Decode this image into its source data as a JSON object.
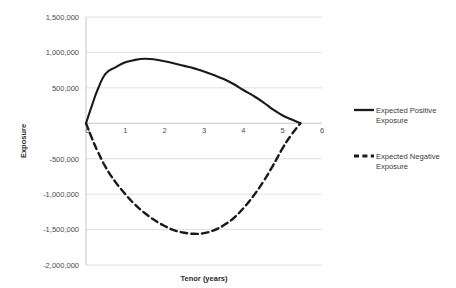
{
  "chart_data": {
    "type": "line",
    "title": "",
    "xlabel": "Tenor (years)",
    "ylabel": "Exposure",
    "xlim": [
      0,
      6
    ],
    "ylim": [
      -2000000,
      1500000
    ],
    "grid": true,
    "legend_position": "right",
    "y_ticks": [
      1500000,
      1000000,
      500000,
      0,
      -500000,
      -1000000,
      -1500000,
      -2000000
    ],
    "y_tick_labels": [
      "1,500,000",
      "1,000,000",
      "500,000",
      "",
      "-500,000",
      "-1,000,000",
      "-1,500,000",
      "-2,000,000"
    ],
    "x_ticks": [
      0,
      1,
      2,
      3,
      4,
      5,
      6
    ],
    "x_tick_labels": [
      "0",
      "1",
      "2",
      "3",
      "4",
      "5",
      "6"
    ],
    "series": [
      {
        "name": "Expected Positive Exposure",
        "style": "solid",
        "color": "#1a1a1a",
        "x": [
          0,
          0.15,
          0.3,
          0.5,
          0.75,
          1.0,
          1.25,
          1.5,
          1.75,
          2.0,
          2.25,
          2.5,
          2.75,
          3.0,
          3.25,
          3.5,
          3.75,
          4.0,
          4.25,
          4.5,
          4.75,
          5.0,
          5.2,
          5.45
        ],
        "y": [
          0,
          250000,
          480000,
          700000,
          790000,
          860000,
          895000,
          910000,
          900000,
          875000,
          845000,
          810000,
          775000,
          730000,
          680000,
          625000,
          555000,
          470000,
          390000,
          300000,
          195000,
          110000,
          60000,
          0
        ]
      },
      {
        "name": "Expected Negative Exposure",
        "style": "dashed",
        "color": "#1a1a1a",
        "x": [
          0,
          0.15,
          0.3,
          0.5,
          0.75,
          1.0,
          1.25,
          1.5,
          1.75,
          2.0,
          2.25,
          2.5,
          2.75,
          3.0,
          3.25,
          3.5,
          3.75,
          4.0,
          4.25,
          4.5,
          4.75,
          5.0,
          5.2,
          5.45
        ],
        "y": [
          0,
          -210000,
          -400000,
          -620000,
          -830000,
          -1000000,
          -1150000,
          -1270000,
          -1370000,
          -1450000,
          -1510000,
          -1545000,
          -1560000,
          -1550000,
          -1510000,
          -1440000,
          -1340000,
          -1200000,
          -1030000,
          -830000,
          -600000,
          -350000,
          -180000,
          0
        ]
      }
    ]
  },
  "legend": {
    "items": [
      {
        "label_line1": "Expected Positive",
        "label_line2": "Exposure",
        "style": "solid"
      },
      {
        "label_line1": "Expected Negative",
        "label_line2": "Exposure",
        "style": "dashed"
      }
    ]
  }
}
